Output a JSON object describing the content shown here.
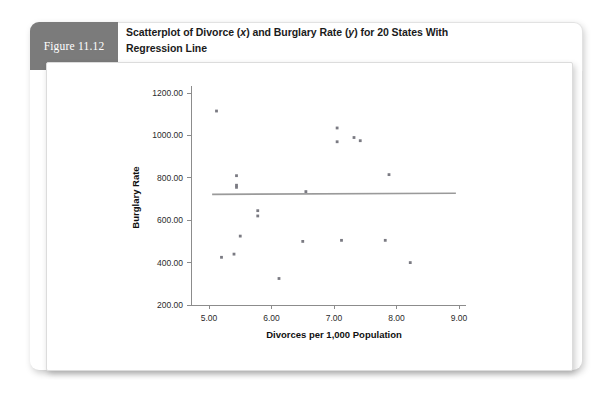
{
  "figure": {
    "tab_label": "Figure 11.12",
    "title_line1_a": "Scatterplot of Divorce (",
    "title_line1_x": "x",
    "title_line1_b": ") and Burglary Rate (",
    "title_line1_y": "y",
    "title_line1_c": ") for 20 States With",
    "title_line2": "Regression Line",
    "tab_color": "#7b7b7b",
    "panel_color": "#ffffff"
  },
  "chart_data": {
    "type": "scatter",
    "title": "Scatterplot of Divorce (x) and Burglary Rate (y) for 20 States With Regression Line",
    "xlabel": "Divorces per 1,000 Population",
    "ylabel": "Burglary Rate",
    "xlim": [
      4.6,
      9.25
    ],
    "ylim": [
      150,
      1260
    ],
    "xticks": [
      5.0,
      6.0,
      7.0,
      8.0,
      9.0
    ],
    "xticklabels": [
      "5.00",
      "6.00",
      "7.00",
      "8.00",
      "9.00"
    ],
    "yticks": [
      200,
      400,
      600,
      800,
      1000,
      1200
    ],
    "yticklabels": [
      "200.00",
      "400.00",
      "600.00",
      "800.00",
      "1000.00",
      "1200.00"
    ],
    "grid": false,
    "legend": null,
    "point_color": "#7a7a82",
    "line_color": "#9a9a9a",
    "points": [
      {
        "x": 5.12,
        "y": 1115
      },
      {
        "x": 5.2,
        "y": 425
      },
      {
        "x": 5.4,
        "y": 440
      },
      {
        "x": 5.44,
        "y": 810
      },
      {
        "x": 5.44,
        "y": 765
      },
      {
        "x": 5.44,
        "y": 755
      },
      {
        "x": 5.5,
        "y": 525
      },
      {
        "x": 5.78,
        "y": 645
      },
      {
        "x": 5.78,
        "y": 620
      },
      {
        "x": 6.12,
        "y": 325
      },
      {
        "x": 6.5,
        "y": 500
      },
      {
        "x": 6.55,
        "y": 735
      },
      {
        "x": 7.05,
        "y": 1035
      },
      {
        "x": 7.05,
        "y": 970
      },
      {
        "x": 7.12,
        "y": 505
      },
      {
        "x": 7.32,
        "y": 990
      },
      {
        "x": 7.42,
        "y": 975
      },
      {
        "x": 7.82,
        "y": 505
      },
      {
        "x": 7.88,
        "y": 815
      },
      {
        "x": 8.22,
        "y": 400
      }
    ],
    "regression_line": {
      "x_start": 5.05,
      "y_start": 722,
      "x_end": 8.95,
      "y_end": 727
    }
  }
}
